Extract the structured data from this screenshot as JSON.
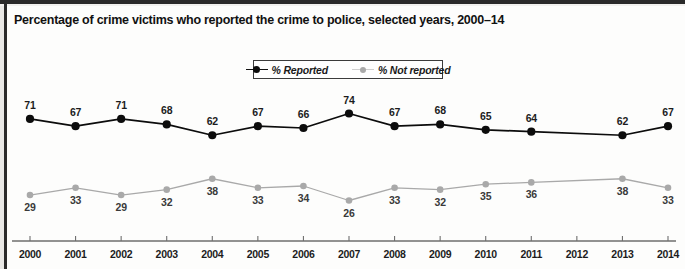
{
  "title": "Percentage of crime victims who reported the crime to police, selected years, 2000–14",
  "legend": {
    "reported_label": "% Reported",
    "not_reported_label": "% Not reported",
    "reported_color": "#0c0c0c",
    "not_reported_color": "#a9a9a9"
  },
  "chart_data": {
    "type": "line",
    "title": "Percentage of crime victims who reported the crime to police, selected years, 2000–14",
    "xlabel": "",
    "ylabel": "",
    "categories": [
      "2000",
      "2001",
      "2002",
      "2003",
      "2004",
      "2005",
      "2006",
      "2007",
      "2008",
      "2009",
      "2010",
      "2011",
      "2012",
      "2013",
      "2014"
    ],
    "x": [
      2000,
      2001,
      2002,
      2003,
      2004,
      2005,
      2006,
      2007,
      2008,
      2009,
      2010,
      2011,
      2012,
      2013,
      2014
    ],
    "ylim": [
      0,
      100
    ],
    "grid": false,
    "legend_position": "top-center",
    "series": [
      {
        "name": "% Reported",
        "color": "#0c0c0c",
        "marker": "filled-circle",
        "values": [
          71,
          67,
          71,
          68,
          62,
          67,
          66,
          74,
          67,
          68,
          65,
          64,
          null,
          62,
          67
        ],
        "label_positions": [
          "above",
          "above",
          "above",
          "above",
          "above",
          "above",
          "above",
          "above",
          "above",
          "above",
          "above",
          "above",
          null,
          "above",
          "above"
        ]
      },
      {
        "name": "% Not reported",
        "color": "#a9a9a9",
        "marker": "filled-circle",
        "values": [
          29,
          33,
          29,
          32,
          38,
          33,
          34,
          26,
          33,
          32,
          35,
          36,
          null,
          38,
          33
        ],
        "label_positions": [
          "below",
          "below",
          "below",
          "below",
          "below",
          "below",
          "below",
          "below",
          "below",
          "below",
          "below",
          "below",
          null,
          "below",
          "below"
        ]
      }
    ]
  },
  "axis": {
    "tick_labels": [
      "2000",
      "2001",
      "2002",
      "2003",
      "2004",
      "2005",
      "2006",
      "2007",
      "2008",
      "2009",
      "2010",
      "2011",
      "2012",
      "2013",
      "2014"
    ]
  }
}
